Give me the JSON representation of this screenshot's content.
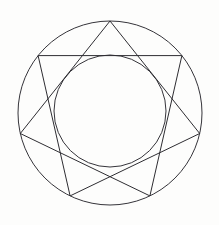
{
  "figure": {
    "background_color": "#fdfdfc",
    "stroke_color": "#2b2b2e",
    "stroke_width": 1,
    "canvas": {
      "width": 219,
      "height": 225
    }
  },
  "chart_data": {
    "type": "line",
    "subtitle": "",
    "xlabel": "",
    "ylabel": "",
    "grid": false,
    "legend": "none",
    "xlim": [
      0,
      219
    ],
    "ylim": [
      0,
      225
    ],
    "geometry": {
      "center": {
        "x": 110,
        "y": 113
      },
      "outer_circle": {
        "cx": 110,
        "cy": 113,
        "r": 92,
        "stroke": "#35343a"
      },
      "inner_circle": {
        "cx": 110,
        "cy": 111,
        "r": 56,
        "stroke": "#35343a"
      },
      "star": {
        "name": "heptagram",
        "schlafli": "{7/2}",
        "points": 7,
        "step": 2,
        "start_angle_deg": -90,
        "circumradius": 92,
        "vertex_angles_deg": [
          -90,
          -38.571,
          12.857,
          64.286,
          115.714,
          167.143,
          218.571
        ],
        "vertices": [
          {
            "index": 0,
            "label": "top-apex",
            "x": 110.0,
            "y": 21.0
          },
          {
            "index": 1,
            "label": "upper-right",
            "x": 181.9,
            "y": 55.6
          },
          {
            "index": 2,
            "label": "mid-right",
            "x": 199.7,
            "y": 133.5
          },
          {
            "index": 3,
            "label": "bottom-right",
            "x": 149.9,
            "y": 195.9
          },
          {
            "index": 4,
            "label": "bottom-left",
            "x": 70.1,
            "y": 195.9
          },
          {
            "index": 5,
            "label": "mid-left",
            "x": 20.3,
            "y": 133.5
          },
          {
            "index": 6,
            "label": "upper-left",
            "x": 38.1,
            "y": 55.6
          }
        ],
        "edge_order": [
          0,
          2,
          4,
          6,
          1,
          3,
          5,
          0
        ],
        "edges": [
          {
            "from": "top-apex",
            "to": "mid-right"
          },
          {
            "from": "mid-right",
            "to": "bottom-left"
          },
          {
            "from": "bottom-left",
            "to": "upper-left"
          },
          {
            "from": "upper-left",
            "to": "upper-right"
          },
          {
            "from": "upper-right",
            "to": "bottom-right"
          },
          {
            "from": "bottom-right",
            "to": "mid-left"
          },
          {
            "from": "mid-left",
            "to": "top-apex"
          }
        ]
      }
    }
  }
}
